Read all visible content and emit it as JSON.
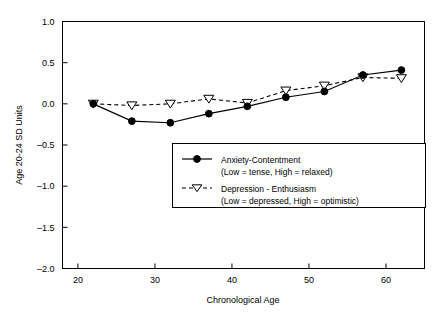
{
  "chart_data": {
    "type": "line",
    "title": "",
    "xlabel": "Chronological Age",
    "ylabel": "Age 20-24 SD Units",
    "xlim": [
      18,
      65
    ],
    "ylim": [
      -2.0,
      1.0
    ],
    "xticks": [
      20,
      30,
      40,
      50,
      60
    ],
    "xtick_labels": [
      "20",
      "30",
      "40",
      "50",
      "60"
    ],
    "yticks": [
      1.0,
      0.5,
      0.0,
      -0.5,
      -1.0,
      -1.5,
      -2.0
    ],
    "ytick_labels": [
      "1.0",
      "0.5",
      "0.0",
      "-0.5",
      "-1.0",
      "-1.5",
      "-2.0"
    ],
    "grid": false,
    "legend_position": "center-right-inside",
    "x": [
      22,
      27,
      32,
      37,
      42,
      47,
      52,
      57,
      62
    ],
    "series": [
      {
        "name": "Anxiety-Contentment",
        "sublabel": "(Low = tense, High = relaxed)",
        "marker": "filled-circle",
        "linestyle": "solid",
        "color": "#000000",
        "values": [
          0.0,
          -0.21,
          -0.23,
          -0.12,
          -0.03,
          0.08,
          0.15,
          0.35,
          0.41
        ]
      },
      {
        "name": "Depression - Enthusiasm",
        "sublabel": "(Low = depressed, High = optimistic)",
        "marker": "open-down-triangle",
        "linestyle": "dashed",
        "color": "#000000",
        "values": [
          0.0,
          -0.02,
          0.0,
          0.06,
          0.01,
          0.16,
          0.22,
          0.32,
          0.31
        ]
      }
    ]
  },
  "legend": {
    "entries": [
      {
        "label": "Anxiety-Contentment",
        "sublabel": "(Low = tense, High = relaxed)"
      },
      {
        "label": "Depression - Enthusiasm",
        "sublabel": "(Low = depressed, High = optimistic)"
      }
    ]
  }
}
